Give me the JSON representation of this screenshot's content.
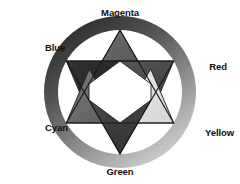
{
  "diagram": {
    "background_color": "#ffffff",
    "ring": {
      "name": "color-wheel-ring",
      "outer_radius": 76,
      "inner_radius": 62,
      "center_x": 120,
      "center_y": 92,
      "gradient_from": "#2b2b2b",
      "gradient_to": "#f2f2f2",
      "gradient_direction": "top-left to bottom-right"
    },
    "star": {
      "name": "hexagram",
      "center_hex_fill": "#ffffff",
      "outline_color": "#1a1a1a",
      "circumradius": 62
    },
    "labels": [
      {
        "id": "magenta",
        "text": "Magenta",
        "position": "top",
        "angle_deg": 90,
        "triangle_fill": "#5e5e5e"
      },
      {
        "id": "red",
        "text": "Red",
        "position": "right",
        "angle_deg": 30,
        "triangle_fill": "#4a4a4a"
      },
      {
        "id": "yellow",
        "text": "Yellow",
        "position": "bottom-right",
        "angle_deg": -30,
        "triangle_fill": "#e0e0e0"
      },
      {
        "id": "green",
        "text": "Green",
        "position": "bottom",
        "angle_deg": -90,
        "triangle_fill": "#3d3d3d"
      },
      {
        "id": "cyan",
        "text": "Cyan",
        "position": "bottom-left",
        "angle_deg": 210,
        "triangle_fill": "#6b6b6b"
      },
      {
        "id": "blue",
        "text": "Blue",
        "position": "top-left",
        "angle_deg": 150,
        "triangle_fill": "#292929"
      }
    ]
  }
}
